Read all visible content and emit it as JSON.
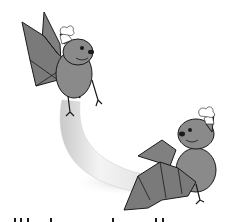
{
  "illustration": {
    "subject": "Two cartoon bats wearing chef hats carrying a banana",
    "colors": {
      "background": "#ffffff",
      "bat_body": "#8a8a8a",
      "bat_wing": "#7a7a7a",
      "outline": "#1a1a1a",
      "banana_light": "#f2f2f2",
      "banana_shade": "#bdbdbd",
      "chef_hat": "#ffffff"
    },
    "figures": [
      {
        "name": "bat-top-left",
        "pose": "flying, wings raised, holding banana top with feet"
      },
      {
        "name": "bat-bottom-right",
        "pose": "wings spread, holding banana bottom"
      },
      {
        "name": "banana",
        "shape": "curved crescent"
      }
    ]
  }
}
